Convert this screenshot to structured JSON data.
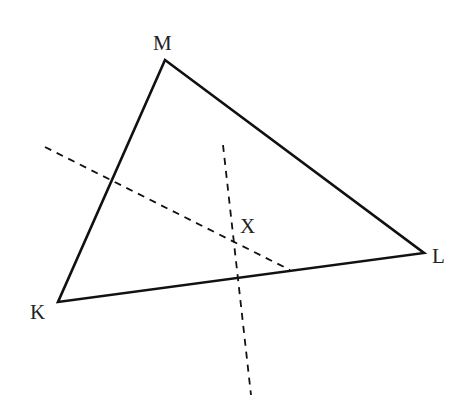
{
  "diagram": {
    "type": "triangle-with-perpendicular-bisectors",
    "vertices": [
      {
        "name": "M",
        "x": 165,
        "y": 60,
        "label_x": 153,
        "label_y": 50
      },
      {
        "name": "K",
        "x": 58,
        "y": 302,
        "label_x": 30,
        "label_y": 319
      },
      {
        "name": "L",
        "x": 424,
        "y": 253,
        "label_x": 432,
        "label_y": 263
      }
    ],
    "point": {
      "name": "X",
      "x": 235,
      "y": 238,
      "label_x": 240,
      "label_y": 233
    },
    "dashed_lines": [
      {
        "name": "bisector-KM",
        "x1": 45,
        "y1": 147,
        "x2": 290,
        "y2": 270
      },
      {
        "name": "bisector-KL",
        "x1": 223,
        "y1": 145,
        "x2": 251,
        "y2": 395
      }
    ],
    "colors": {
      "stroke": "#111111",
      "background": "#ffffff"
    }
  }
}
